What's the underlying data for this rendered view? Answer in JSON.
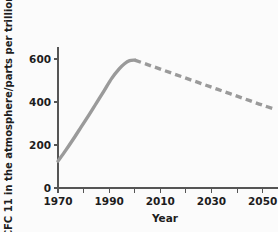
{
  "chart_data": {
    "type": "line",
    "title": "",
    "subtitle": "",
    "xlabel": "Year",
    "ylabel": "CFC 11 in the atmosphere/parts per trillion",
    "xlim": [
      1970,
      2056
    ],
    "ylim": [
      0,
      625
    ],
    "grid": false,
    "legend": null,
    "x_ticks_major": [
      1970,
      1990,
      2010,
      2030,
      2050
    ],
    "x_tick_labels": [
      "1970",
      "1990",
      "2010",
      "2030",
      "2050"
    ],
    "x_ticks_minor": [
      1980,
      2000,
      2020,
      2040
    ],
    "y_ticks": [
      0,
      200,
      400,
      600
    ],
    "y_tick_labels": [
      "0",
      "200",
      "400",
      "600"
    ],
    "line_color": "#9a9a9a",
    "axis_color": "#555555",
    "background_color": "#fbfbfb",
    "series": [
      {
        "name": "measured",
        "style": "solid",
        "x": [
          1970,
          1973,
          1976,
          1979,
          1982,
          1985,
          1988,
          1991,
          1994,
          1996,
          1998,
          2000
        ],
        "y": [
          125,
          175,
          228,
          283,
          338,
          395,
          452,
          510,
          555,
          578,
          592,
          595
        ]
      },
      {
        "name": "projected",
        "style": "dashed",
        "x": [
          2000,
          2005,
          2010,
          2015,
          2020,
          2025,
          2030,
          2035,
          2040,
          2045,
          2050,
          2055
        ],
        "y": [
          595,
          574,
          553,
          532,
          511,
          490,
          469,
          448,
          427,
          406,
          385,
          366
        ]
      }
    ],
    "annotations": []
  }
}
